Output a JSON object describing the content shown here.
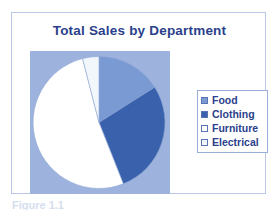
{
  "chart": {
    "title": "Total Sales by Department",
    "title_color": "#2B3F8C",
    "plot_background": "#9DB3DE",
    "frame_border_color": "#B9C7E4"
  },
  "legend": {
    "position": "right",
    "background": "#FFFFFF",
    "border_color": "#9AADD6",
    "items": [
      {
        "label": "Food",
        "color": "#7A9AD4"
      },
      {
        "label": "Clothing",
        "color": "#3A62AC"
      },
      {
        "label": "Furniture",
        "color": "#FFFFFF"
      },
      {
        "label": "Electrical",
        "color": "#F2F7FC"
      }
    ]
  },
  "caption": {
    "text": "Figure 1.1"
  },
  "chart_data": {
    "type": "pie",
    "title": "Total Sales by Department",
    "xlabel": "",
    "ylabel": "",
    "grid": false,
    "legend_position": "right",
    "categories": [
      "Food",
      "Clothing",
      "Furniture",
      "Electrical"
    ],
    "values": [
      16,
      28,
      52,
      4
    ],
    "units": "percent",
    "colors": [
      "#7A9AD4",
      "#3A62AC",
      "#FFFFFF",
      "#F2F7FC"
    ],
    "start_angle_deg": 0,
    "direction": "clockwise",
    "slices": [
      {
        "label": "Food",
        "value": 16,
        "start_deg": 0,
        "end_deg": 57.6,
        "color": "#7A9AD4"
      },
      {
        "label": "Clothing",
        "value": 28,
        "start_deg": 57.6,
        "end_deg": 158.4,
        "color": "#3A62AC"
      },
      {
        "label": "Furniture",
        "value": 52,
        "start_deg": 158.4,
        "end_deg": 345.6,
        "color": "#FFFFFF"
      },
      {
        "label": "Electrical",
        "value": 4,
        "start_deg": 345.6,
        "end_deg": 360,
        "color": "#F2F7FC"
      }
    ]
  }
}
